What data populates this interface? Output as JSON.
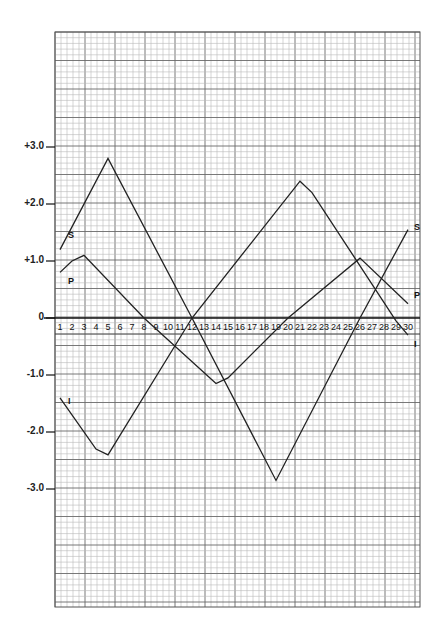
{
  "chart_data": {
    "type": "line",
    "title": "",
    "xlabel": "",
    "ylabel": "",
    "x": [
      1,
      2,
      3,
      4,
      5,
      6,
      7,
      8,
      9,
      10,
      11,
      12,
      13,
      14,
      15,
      16,
      17,
      18,
      19,
      20,
      21,
      22,
      23,
      24,
      25,
      26,
      27,
      28,
      29,
      30
    ],
    "x_tick_labels": [
      "1",
      "2",
      "3",
      "4",
      "5",
      "6",
      "7",
      "8",
      "9",
      "10",
      "11",
      "12",
      "13",
      "14",
      "15",
      "16",
      "17",
      "18",
      "19",
      "20",
      "21",
      "22",
      "23",
      "24",
      "25",
      "26",
      "27",
      "28",
      "29",
      "30"
    ],
    "y_tick_labels": [
      "+3.0",
      "+2.0",
      "+1.0",
      "0",
      "-1.0",
      "-2.0",
      "-3.0"
    ],
    "y_ticks": [
      3.0,
      2.0,
      1.0,
      0,
      -1.0,
      -2.0,
      -3.0
    ],
    "ylim": [
      -5.0,
      5.0
    ],
    "xlim": [
      0.6,
      30.8
    ],
    "grid": true,
    "legend_position": "inline labels at line ends",
    "series": [
      {
        "name": "S",
        "label_start": "S",
        "label_end": "S",
        "points": [
          [
            1,
            1.2
          ],
          [
            5,
            2.8
          ],
          [
            12,
            0
          ],
          [
            19,
            -2.85
          ],
          [
            26,
            0
          ],
          [
            30,
            1.55
          ]
        ]
      },
      {
        "name": "P",
        "label_start": "P",
        "label_end": "P",
        "points": [
          [
            1,
            0.8
          ],
          [
            2,
            1.0
          ],
          [
            3,
            1.1
          ],
          [
            8,
            0
          ],
          [
            14,
            -1.15
          ],
          [
            15,
            -1.05
          ],
          [
            20,
            0
          ],
          [
            26,
            1.05
          ],
          [
            30,
            0.25
          ]
        ]
      },
      {
        "name": "I",
        "label_start": "I",
        "label_end": "I",
        "points": [
          [
            1,
            -1.4
          ],
          [
            4,
            -2.3
          ],
          [
            5,
            -2.4
          ],
          [
            12,
            0
          ],
          [
            21,
            2.4
          ],
          [
            22,
            2.2
          ],
          [
            29,
            -0.05
          ],
          [
            30,
            -0.3
          ]
        ]
      }
    ]
  },
  "colors": {
    "grid_minor": "#b8b8b8",
    "grid_major": "#6a6a6a",
    "line": "#222222",
    "background": "#ffffff"
  }
}
